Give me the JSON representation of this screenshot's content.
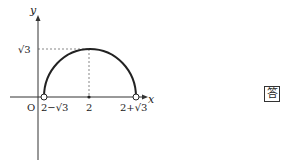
{
  "diagram": {
    "axes": {
      "x_label": "x",
      "y_label": "y",
      "origin_label": "O"
    },
    "curve": {
      "type": "semicircle",
      "center_x": "2",
      "peak_y": "√3"
    },
    "x_ticks": [
      "2−√3",
      "2",
      "2+√3"
    ],
    "y_ticks": [
      "√3"
    ],
    "endpoints": "open-circles"
  },
  "answer_badge": {
    "label": "答"
  }
}
